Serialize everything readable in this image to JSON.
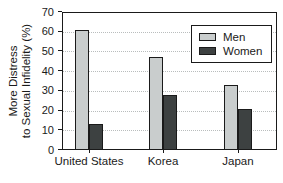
{
  "chart_data": {
    "type": "bar",
    "title": "",
    "xlabel": "",
    "ylabel_lines": [
      "More Distress",
      "to Sexual Infidelity (%)"
    ],
    "categories": [
      "United States",
      "Korea",
      "Japan"
    ],
    "series": [
      {
        "name": "Men",
        "color": "#c9cdcd",
        "values": [
          61,
          47,
          33
        ]
      },
      {
        "name": "Women",
        "color": "#3d4141",
        "values": [
          13,
          28,
          21
        ]
      }
    ],
    "ylim": [
      0,
      70
    ],
    "yticks": [
      0,
      10,
      20,
      30,
      40,
      50,
      60,
      70
    ],
    "grid": "horizontal-dotted",
    "legend_position": "top-right",
    "colors": {
      "axis": "#1a1a1a",
      "gridline": "#b9bdbd",
      "background": "#ffffff",
      "bar_border": "#1a1a1a",
      "text": "#1a1a1a"
    }
  }
}
